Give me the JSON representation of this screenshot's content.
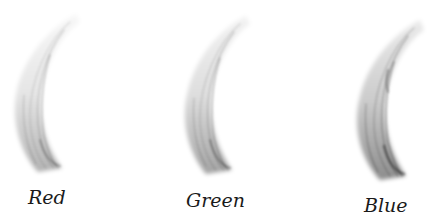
{
  "channels": [
    {
      "label": "Red",
      "intensity": 0.55
    },
    {
      "label": "Green",
      "intensity": 0.65
    },
    {
      "label": "Blue",
      "intensity": 0.85
    }
  ]
}
